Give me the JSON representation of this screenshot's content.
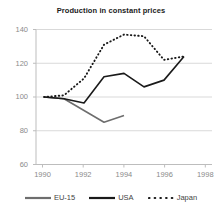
{
  "chart_data": {
    "type": "line",
    "title": "Production in constant prices",
    "xlabel": "",
    "ylabel": "",
    "xlim": [
      1989.6,
      1998.4
    ],
    "ylim": [
      60,
      140
    ],
    "grid": true,
    "grid_axis": "y",
    "legend_position": "bottom",
    "x": [
      1990,
      1991,
      1992,
      1993,
      1994,
      1995,
      1996,
      1997
    ],
    "xticks": [
      1990,
      1992,
      1994,
      1996,
      1998
    ],
    "xtick_labels": [
      "1990",
      "1992",
      "1994",
      "1996",
      "1998"
    ],
    "yticks": [
      60,
      80,
      100,
      120,
      140
    ],
    "ytick_labels": [
      "60",
      "80",
      "100",
      "120",
      "140"
    ],
    "series": [
      {
        "name": "EU-15",
        "color": "#6e6e6e",
        "style": "solid",
        "x": [
          1990,
          1991,
          1992,
          1993,
          1994
        ],
        "values": [
          100,
          99,
          92,
          85,
          89
        ]
      },
      {
        "name": "USA",
        "color": "#1a1a1a",
        "style": "solid",
        "x": [
          1990,
          1991,
          1992,
          1993,
          1994,
          1995,
          1996,
          1997
        ],
        "values": [
          100,
          99,
          96.5,
          112,
          114,
          106,
          110,
          124
        ]
      },
      {
        "name": "Japan",
        "color": "#1a1a1a",
        "style": "dotted",
        "x": [
          1990,
          1991,
          1992,
          1993,
          1994,
          1995,
          1996,
          1997
        ],
        "values": [
          100,
          101,
          111,
          131,
          137,
          136,
          122,
          124
        ]
      }
    ]
  },
  "title": "Production in constant prices",
  "axes": {
    "y_labels": [
      "140",
      "120",
      "100",
      "80",
      "60"
    ],
    "x_labels": [
      "1990",
      "1992",
      "1994",
      "1996",
      "1998"
    ]
  },
  "legend": {
    "items": [
      {
        "label": "EU-15",
        "color": "#6e6e6e",
        "style": "solid"
      },
      {
        "label": "USA",
        "color": "#1a1a1a",
        "style": "solid"
      },
      {
        "label": "Japan",
        "color": "#1a1a1a",
        "style": "dotted"
      }
    ]
  }
}
